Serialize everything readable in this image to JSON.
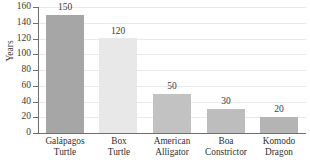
{
  "chart_data": {
    "type": "bar",
    "title": "",
    "xlabel": "",
    "ylabel": "Years",
    "ylim": [
      0,
      160
    ],
    "ytick_step": 20,
    "grid": true,
    "legend": false,
    "categories": [
      "Galápagos Turtle",
      "Box Turtle",
      "American Alligator",
      "Boa Constrictor",
      "Komodo Dragon"
    ],
    "category_lines": [
      [
        "Galápagos",
        "Turtle"
      ],
      [
        "Box",
        "Turtle"
      ],
      [
        "American",
        "Alligator"
      ],
      [
        "Boa",
        "Constrictor"
      ],
      [
        "Komodo",
        "Dragon"
      ]
    ],
    "values": [
      150,
      120,
      50,
      30,
      20
    ],
    "value_labels": [
      "150",
      "120",
      "50",
      "30",
      "20"
    ],
    "bar_colors": [
      "#a6a6a6",
      "#e8e8e8",
      "#c2c2c2",
      "#bdbdbd",
      "#b4b4b4"
    ],
    "ytick_labels": [
      "0",
      "20",
      "40",
      "60",
      "80",
      "100",
      "120",
      "140",
      "160"
    ],
    "ytick_values": [
      0,
      20,
      40,
      60,
      80,
      100,
      120,
      140,
      160
    ]
  },
  "axis": {
    "y_title": "Years"
  },
  "title_remnant": "",
  "colors": {
    "axis": "#6e6e6e",
    "gridline": "#e9e9e9",
    "text": "#3a3a3a",
    "background": "#ffffff"
  }
}
